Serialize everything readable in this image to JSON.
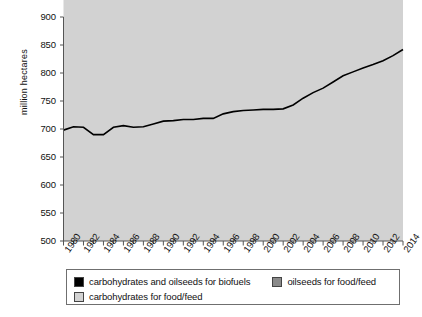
{
  "chart_data": {
    "type": "area",
    "stacked": true,
    "title": "",
    "xlabel": "",
    "ylabel": "million hectares",
    "ylim": [
      500,
      900
    ],
    "yticks": [
      500,
      550,
      600,
      650,
      700,
      750,
      800,
      850,
      900
    ],
    "xlim": [
      1980,
      2014
    ],
    "x": [
      1980,
      1981,
      1982,
      1983,
      1984,
      1985,
      1986,
      1987,
      1988,
      1989,
      1990,
      1991,
      1992,
      1993,
      1994,
      1995,
      1996,
      1997,
      1998,
      1999,
      2000,
      2001,
      2002,
      2003,
      2004,
      2005,
      2006,
      2007,
      2008,
      2009,
      2010,
      2011,
      2012,
      2013,
      2014
    ],
    "xticklabels": [
      "1980",
      "1982",
      "1984",
      "1986",
      "1988",
      "1990",
      "1992",
      "1994",
      "1996",
      "1998",
      "2000",
      "2002",
      "2004",
      "2006",
      "2008",
      "2010",
      "2012",
      "2014"
    ],
    "grid": false,
    "legend_position": "below-plot",
    "series": [
      {
        "name": "carbohydrates for food/feed",
        "color": "#d2d2d2",
        "values": [
          623,
          626,
          627,
          618,
          612,
          620,
          621,
          615,
          614,
          619,
          622,
          620,
          619,
          617,
          616,
          612,
          617,
          619,
          618,
          617,
          616,
          613,
          612,
          616,
          617,
          616,
          614,
          612,
          610,
          608,
          606,
          604,
          602,
          601,
          600
        ]
      },
      {
        "name": "oilseeds for food/feed",
        "color": "#8a8a8a",
        "values": [
          75,
          78,
          76,
          72,
          78,
          83,
          85,
          88,
          90,
          90,
          92,
          95,
          98,
          100,
          103,
          107,
          110,
          112,
          115,
          117,
          119,
          122,
          124,
          126,
          132,
          136,
          139,
          143,
          148,
          152,
          157,
          162,
          168,
          174,
          182
        ]
      },
      {
        "name": "carbohydrates and oilseeds for biofuels",
        "color": "#000000",
        "values": [
          0,
          0,
          0,
          0,
          0,
          0,
          0,
          0,
          0,
          0,
          0,
          0,
          0,
          0,
          0,
          0,
          0,
          0,
          0,
          0,
          0,
          0,
          0,
          1,
          6,
          13,
          20,
          29,
          37,
          42,
          46,
          49,
          52,
          56,
          60
        ]
      }
    ],
    "totals": [
      698,
      704,
      703,
      690,
      690,
      703,
      706,
      703,
      704,
      709,
      714,
      715,
      717,
      717,
      719,
      719,
      727,
      731,
      733,
      734,
      735,
      735,
      736,
      743,
      755,
      765,
      773,
      784,
      795,
      802,
      809,
      815,
      822,
      831,
      842
    ]
  },
  "legend": {
    "items": [
      {
        "label": "carbohydrates and oilseeds for biofuels",
        "color": "#000000"
      },
      {
        "label": "oilseeds for food/feed",
        "color": "#8a8a8a"
      },
      {
        "label": "carbohydrates for food/feed",
        "color": "#d2d2d2"
      }
    ]
  }
}
